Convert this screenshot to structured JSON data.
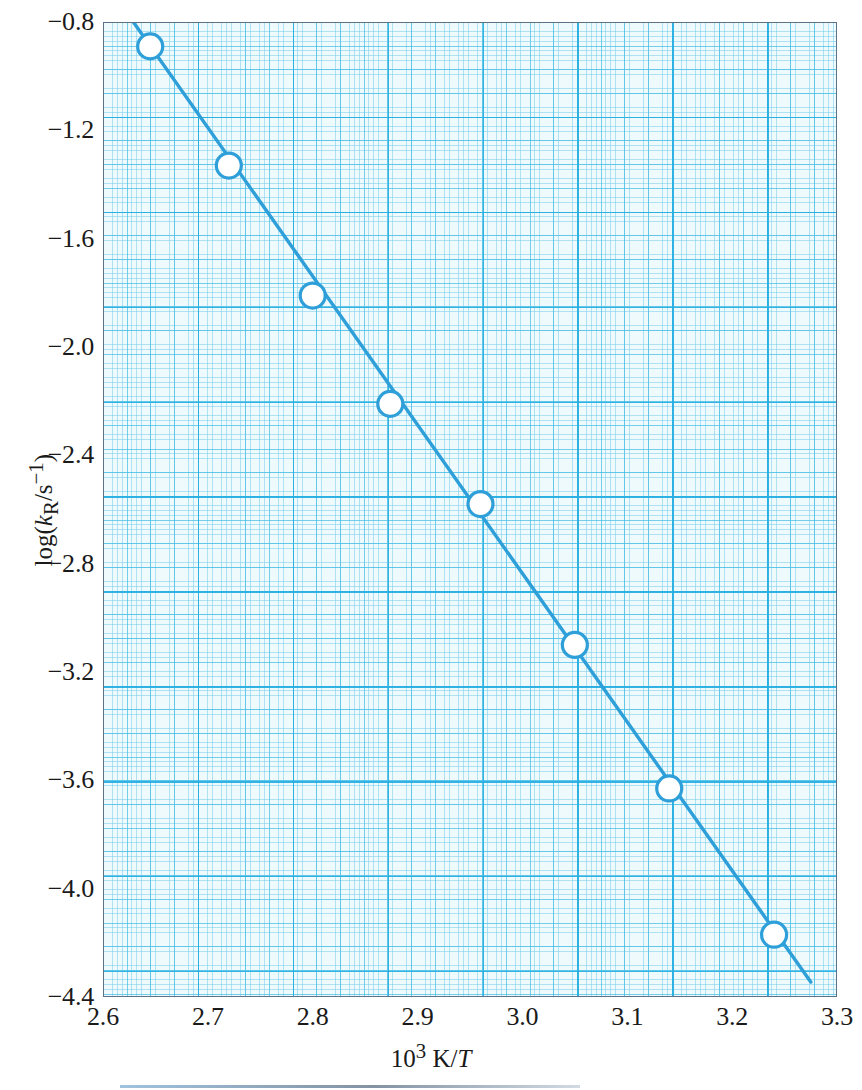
{
  "figure": {
    "background_color": "#ffffff",
    "frame_color": "#5d7286",
    "grid_color": "#4abee6",
    "data_color": "#2e9fd8"
  },
  "axes": {
    "x": {
      "label_html": "10<sup>3</sup> K/<i>T</i>",
      "label_plain": "10^3 K/T",
      "min": 2.6,
      "max": 3.3,
      "ticks": [
        "2.6",
        "2.7",
        "2.8",
        "2.9",
        "3.0",
        "3.1",
        "3.2",
        "3.3"
      ],
      "tick_values": [
        2.6,
        2.7,
        2.8,
        2.9,
        3.0,
        3.1,
        3.2,
        3.3
      ]
    },
    "y": {
      "label_html": "log(<i>k</i><sub>R</sub>/s<sup>&minus;1</sup>)",
      "label_plain": "log(kR/s^-1)",
      "min": -4.4,
      "max": -0.8,
      "ticks": [
        "−0.8",
        "−1.2",
        "−1.6",
        "−2.0",
        "−2.4",
        "−2.8",
        "−3.2",
        "−3.6",
        "−4.0",
        "−4.4"
      ],
      "tick_values": [
        -0.8,
        -1.2,
        -1.6,
        -2.0,
        -2.4,
        -2.8,
        -3.2,
        -3.6,
        -4.0,
        -4.4
      ]
    }
  },
  "chart_data": {
    "type": "scatter",
    "title": "",
    "subtitle": "",
    "xlabel": "10^3 K/T",
    "ylabel": "log(kR/s^-1)",
    "xlim": [
      2.6,
      3.3
    ],
    "ylim": [
      -4.4,
      -0.8
    ],
    "grid": true,
    "grid_style": "graph-paper, major every 0.1 in x and 0.4 in y, fine minor rulings",
    "legend": null,
    "legend_position": "none",
    "marker": "open-circle",
    "series": [
      {
        "name": "Arrhenius data",
        "marker": "open-circle",
        "color": "#2e9fd8",
        "x": [
          2.645,
          2.72,
          2.8,
          2.874,
          2.96,
          3.05,
          3.14,
          3.24
        ],
        "y": [
          -0.89,
          -1.33,
          -1.81,
          -2.21,
          -2.58,
          -3.1,
          -3.63,
          -4.17
        ]
      },
      {
        "name": "Least-squares fit line",
        "type": "line",
        "color": "#2e9fd8",
        "x": [
          2.628,
          2.275
        ],
        "x_endpoints": [
          2.628,
          3.275
        ],
        "y_endpoints": [
          -0.795,
          -4.345
        ]
      }
    ],
    "fit": {
      "slope": -5.49,
      "intercept": 13.64,
      "note": "log(kR/s^-1) decreases linearly with 10^3 K/T"
    }
  }
}
